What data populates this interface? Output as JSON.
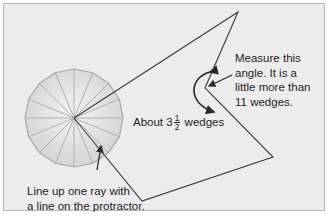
{
  "figure": {
    "panel_background": "#ececec",
    "panel_border": "#b5b5b5",
    "line_color": "#3a3a3a",
    "protractor": {
      "fill": "#dcdcdc",
      "edge": "#a8a8a8",
      "wedge_count": 16,
      "center": [
        74,
        118
      ],
      "radius": 49
    },
    "angle_path": [
      [
        74,
        118
      ],
      [
        238,
        12
      ],
      [
        205,
        88
      ],
      [
        273,
        157
      ],
      [
        142,
        201
      ],
      [
        74,
        118
      ]
    ],
    "measured_vertex": [
      205,
      88
    ]
  },
  "annotations": {
    "measure": {
      "line1": "Measure this",
      "line2": "angle. It is a",
      "line3": "little more than",
      "line4": "11 wedges."
    },
    "about": {
      "prefix": "About 3",
      "frac_num": "1",
      "frac_den": "2",
      "suffix": "wedges"
    },
    "lineup": {
      "line1": "Line up one ray with",
      "line2": "a line on the protractor."
    }
  }
}
